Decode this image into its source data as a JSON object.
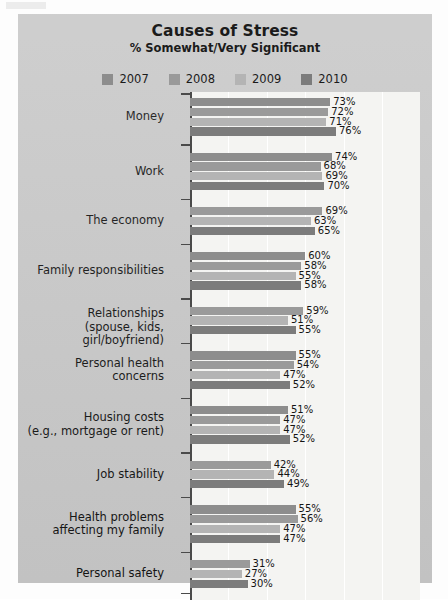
{
  "header": {
    "title": "Causes of Stress",
    "subtitle": "% Somewhat/Very Significant"
  },
  "chart_data": {
    "type": "bar",
    "orientation": "horizontal",
    "title": "Causes of Stress",
    "subtitle": "% Somewhat/Very Significant",
    "xlabel": "",
    "ylabel": "",
    "xlim": [
      0,
      100
    ],
    "grid": true,
    "legend_position": "top",
    "value_suffix": "%",
    "series": [
      {
        "name": "2007",
        "color": "#8d8d8d"
      },
      {
        "name": "2008",
        "color": "#9a9a9a"
      },
      {
        "name": "2009",
        "color": "#b4b4b4"
      },
      {
        "name": "2010",
        "color": "#7c7c7c"
      }
    ],
    "categories": [
      {
        "label": "Money",
        "label_lines": [
          "Money"
        ],
        "points": [
          {
            "series": "2007",
            "value": 73,
            "label": "73%"
          },
          {
            "series": "2008",
            "value": 72,
            "label": "72%"
          },
          {
            "series": "2009",
            "value": 71,
            "label": "71%"
          },
          {
            "series": "2010",
            "value": 76,
            "label": "76%"
          }
        ]
      },
      {
        "label": "Work",
        "label_lines": [
          "Work"
        ],
        "points": [
          {
            "series": "2007",
            "value": 74,
            "label": "74%"
          },
          {
            "series": "2008",
            "value": 68,
            "label": "68%"
          },
          {
            "series": "2009",
            "value": 69,
            "label": "69%"
          },
          {
            "series": "2010",
            "value": 70,
            "label": "70%"
          }
        ]
      },
      {
        "label": "The economy",
        "label_lines": [
          "The economy"
        ],
        "points": [
          {
            "series": "2008",
            "value": 69,
            "label": "69%"
          },
          {
            "series": "2009",
            "value": 63,
            "label": "63%"
          },
          {
            "series": "2010",
            "value": 65,
            "label": "65%"
          }
        ]
      },
      {
        "label": "Family responsibilities",
        "label_lines": [
          "Family responsibilities"
        ],
        "points": [
          {
            "series": "2007",
            "value": 60,
            "label": "60%"
          },
          {
            "series": "2008",
            "value": 58,
            "label": "58%"
          },
          {
            "series": "2009",
            "value": 55,
            "label": "55%"
          },
          {
            "series": "2010",
            "value": 58,
            "label": "58%"
          }
        ]
      },
      {
        "label": "Relationships (spouse, kids, girl/boyfriend)",
        "label_lines": [
          "Relationships",
          "(spouse, kids, girl/boyfriend)"
        ],
        "points": [
          {
            "series": "2008",
            "value": 59,
            "label": "59%"
          },
          {
            "series": "2009",
            "value": 51,
            "label": "51%"
          },
          {
            "series": "2010",
            "value": 55,
            "label": "55%"
          }
        ]
      },
      {
        "label": "Personal health concerns",
        "label_lines": [
          "Personal health",
          "concerns"
        ],
        "points": [
          {
            "series": "2007",
            "value": 55,
            "label": "55%"
          },
          {
            "series": "2008",
            "value": 54,
            "label": "54%"
          },
          {
            "series": "2009",
            "value": 47,
            "label": "47%"
          },
          {
            "series": "2010",
            "value": 52,
            "label": "52%"
          }
        ]
      },
      {
        "label": "Housing costs (e.g., mortgage or rent)",
        "label_lines": [
          "Housing costs",
          "(e.g., mortgage or rent)"
        ],
        "points": [
          {
            "series": "2007",
            "value": 51,
            "label": "51%"
          },
          {
            "series": "2008",
            "value": 47,
            "label": "47%"
          },
          {
            "series": "2009",
            "value": 47,
            "label": "47%"
          },
          {
            "series": "2010",
            "value": 52,
            "label": "52%"
          }
        ]
      },
      {
        "label": "Job stability",
        "label_lines": [
          "Job stability"
        ],
        "points": [
          {
            "series": "2008",
            "value": 42,
            "label": "42%"
          },
          {
            "series": "2009",
            "value": 44,
            "label": "44%"
          },
          {
            "series": "2010",
            "value": 49,
            "label": "49%"
          }
        ]
      },
      {
        "label": "Health problems affecting my family",
        "label_lines": [
          "Health problems",
          "affecting my family"
        ],
        "points": [
          {
            "series": "2007",
            "value": 55,
            "label": "55%"
          },
          {
            "series": "2008",
            "value": 56,
            "label": "56%"
          },
          {
            "series": "2009",
            "value": 47,
            "label": "47%"
          },
          {
            "series": "2010",
            "value": 47,
            "label": "47%"
          }
        ]
      },
      {
        "label": "Personal safety",
        "label_lines": [
          "Personal safety"
        ],
        "points": [
          {
            "series": "2008",
            "value": 31,
            "label": "31%"
          },
          {
            "series": "2009",
            "value": 27,
            "label": "27%"
          },
          {
            "series": "2010",
            "value": 30,
            "label": "30%"
          }
        ]
      }
    ]
  },
  "style": {
    "frame_color": "#c9c9c9",
    "plot_background": "#f4f4f2",
    "axis_color": "#4a4a4a",
    "gridline_color": "#ffffff",
    "text_color": "#141414"
  }
}
